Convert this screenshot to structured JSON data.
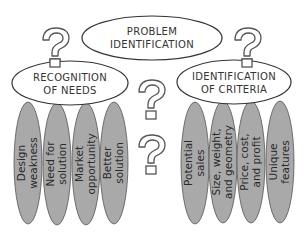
{
  "diagram": {
    "root": {
      "line1": "PROBLEM",
      "line2": "IDENTIFICATION"
    },
    "left_branch": {
      "line1": "RECOGNITION",
      "line2": "OF  NEEDS",
      "items": [
        {
          "line1": "Design",
          "line2": "weakness"
        },
        {
          "line1": "Need  for",
          "line2": "solution"
        },
        {
          "line1": "Market",
          "line2": "opportunity"
        },
        {
          "line1": "Better",
          "line2": "solution"
        }
      ]
    },
    "right_branch": {
      "line1": "IDENTIFICATION",
      "line2": "OF  CRITERIA",
      "items": [
        {
          "line1": "Potential",
          "line2": "sales"
        },
        {
          "line1": "Size,  weight,",
          "line2": "and  geometry"
        },
        {
          "line1": "Price,  cost,",
          "line2": "and  profit"
        },
        {
          "line1": "Unique",
          "line2": "features"
        }
      ]
    },
    "question_marks": 4,
    "colors": {
      "item_fill": "#a9a9a9",
      "stroke": "#333333",
      "qmark_stroke": "#555555"
    }
  }
}
